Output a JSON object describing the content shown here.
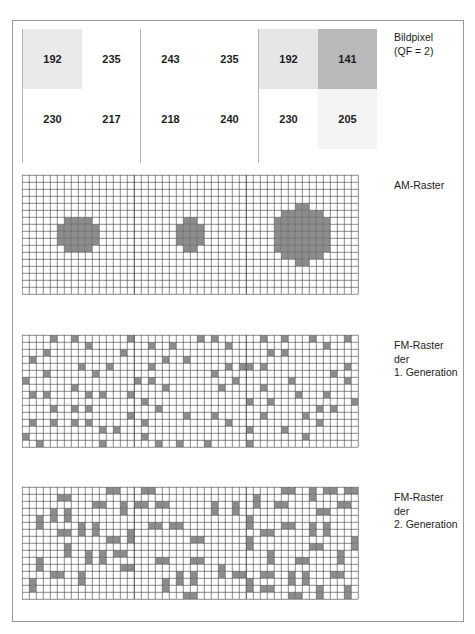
{
  "top_caption": "",
  "figure": {
    "labels": {
      "pixels": "Bildpixel\n(QF = 2)",
      "am": "AM-Raster",
      "fm1": "FM-Raster\nder\n1. Generation",
      "fm2": "FM-Raster\nder\n2. Generation"
    }
  },
  "chart_data": {
    "type": "heatmap",
    "xlabel": "",
    "ylabel": "",
    "grid": true,
    "legend_position": "right",
    "annotations": [
      "Bildpixel (QF = 2)",
      "AM-Raster",
      "FM-Raster der 1. Generation",
      "FM-Raster der 2. Generation"
    ],
    "pixel_groups": [
      {
        "name": "group-1",
        "values": [
          [
            192,
            235
          ],
          [
            230,
            217
          ]
        ],
        "shades": [
          "#eaeaea",
          "#ffffff",
          "#ffffff",
          "#ffffff"
        ],
        "mean_value": 218.5,
        "am_dot_radius_cells": 3.0,
        "fm1_coverage_pct": 16,
        "fm2_coverage_pct": 16
      },
      {
        "name": "group-2",
        "values": [
          [
            243,
            235
          ],
          [
            218,
            240
          ]
        ],
        "shades": [
          "#ffffff",
          "#ffffff",
          "#ffffff",
          "#ffffff"
        ],
        "mean_value": 234.0,
        "am_dot_radius_cells": 2.3,
        "fm1_coverage_pct": 12,
        "fm2_coverage_pct": 12
      },
      {
        "name": "group-3",
        "values": [
          [
            192,
            141
          ],
          [
            230,
            205
          ]
        ],
        "shades": [
          "#e6e6e6",
          "#b9b9b9",
          "#ffffff",
          "#f4f4f4"
        ],
        "mean_value": 192.0,
        "am_dot_radius_cells": 4.2,
        "fm1_coverage_pct": 22,
        "fm2_coverage_pct": 22
      }
    ],
    "colors": {
      "dot_fill": "#8c8c8c",
      "grid_line": "#3c3c3c",
      "frame": "#9a9a9a",
      "text": "#1d1d1d"
    },
    "am_raster": {
      "cell_px": 7.0,
      "cols_per_group": 16,
      "rows": 17
    },
    "fm1_raster": {
      "cell_px": 7.0,
      "cols_per_group": 16,
      "rows": 16,
      "cluster_size": 1
    },
    "fm2_raster": {
      "cell_px": 7.0,
      "cols_per_group": 16,
      "rows": 16,
      "cluster_size": 2
    }
  }
}
